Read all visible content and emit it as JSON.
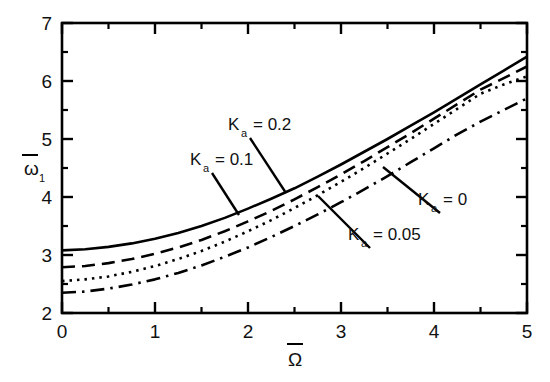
{
  "chart_data": {
    "type": "line",
    "title": "",
    "xlabel": "Ω̄",
    "ylabel": "ω̄1",
    "xlim": [
      0,
      5
    ],
    "ylim": [
      2,
      7
    ],
    "grid": false,
    "legend_position": "inline-annotations",
    "x_ticks": [
      "0",
      "1",
      "2",
      "3",
      "4",
      "5"
    ],
    "y_ticks": [
      "2",
      "3",
      "4",
      "5",
      "6",
      "7"
    ],
    "x_minor_ticks": [
      0.5,
      1.5,
      2.5,
      3.5,
      4.5
    ],
    "y_minor_ticks": [
      2.5,
      3.5,
      4.5,
      5.5,
      6.5
    ],
    "x": [
      0,
      0.25,
      0.5,
      0.75,
      1,
      1.25,
      1.5,
      1.75,
      2,
      2.25,
      2.5,
      2.75,
      3,
      3.25,
      3.5,
      3.75,
      4,
      4.25,
      4.5,
      4.75,
      5
    ],
    "series": [
      {
        "name": "Ka = 0.2",
        "label_text": "K",
        "label_sub": "a",
        "label_value": "= 0.2",
        "style": "solid",
        "values": [
          3.08,
          3.1,
          3.14,
          3.2,
          3.28,
          3.38,
          3.5,
          3.64,
          3.8,
          3.97,
          4.15,
          4.35,
          4.56,
          4.78,
          5.0,
          5.23,
          5.46,
          5.7,
          5.94,
          6.18,
          6.42
        ]
      },
      {
        "name": "Ka = 0.1",
        "label_text": "K",
        "label_sub": "a",
        "label_value": "= 0.1",
        "style": "dashed",
        "values": [
          2.79,
          2.81,
          2.86,
          2.93,
          3.02,
          3.13,
          3.26,
          3.41,
          3.58,
          3.76,
          3.96,
          4.17,
          4.39,
          4.62,
          4.86,
          5.1,
          5.35,
          5.6,
          5.85,
          6.05,
          6.25
        ]
      },
      {
        "name": "Ka = 0.05",
        "label_text": "K",
        "label_sub": "a",
        "label_value": "= 0.05",
        "style": "dotted",
        "values": [
          2.55,
          2.58,
          2.63,
          2.71,
          2.81,
          2.93,
          3.07,
          3.23,
          3.41,
          3.6,
          3.81,
          4.03,
          4.26,
          4.5,
          4.75,
          5.0,
          5.26,
          5.52,
          5.78,
          5.94,
          6.08
        ]
      },
      {
        "name": "Ka = 0",
        "label_text": "K",
        "label_sub": "a",
        "label_value": "= 0",
        "style": "dashdot",
        "values": [
          2.35,
          2.37,
          2.42,
          2.49,
          2.58,
          2.69,
          2.82,
          2.97,
          3.13,
          3.31,
          3.5,
          3.7,
          3.91,
          4.13,
          4.36,
          4.6,
          4.84,
          5.08,
          5.3,
          5.5,
          5.7
        ]
      }
    ],
    "annotations": [
      {
        "id": "ann-ka-02",
        "text": "K",
        "sub": "a",
        "value": "= 0.2",
        "x": 228,
        "y": 130
      },
      {
        "id": "ann-ka-01",
        "text": "K",
        "sub": "a",
        "value": "= 0.1",
        "x": 190,
        "y": 165
      },
      {
        "id": "ann-ka-0",
        "text": "K",
        "sub": "a",
        "value": "= 0",
        "x": 418,
        "y": 205
      },
      {
        "id": "ann-ka-005",
        "text": "K",
        "sub": "a",
        "value": "= 0.05",
        "x": 348,
        "y": 240
      }
    ],
    "colors": {
      "line": "#000000",
      "axis": "#000000",
      "background": "#ffffff"
    }
  }
}
